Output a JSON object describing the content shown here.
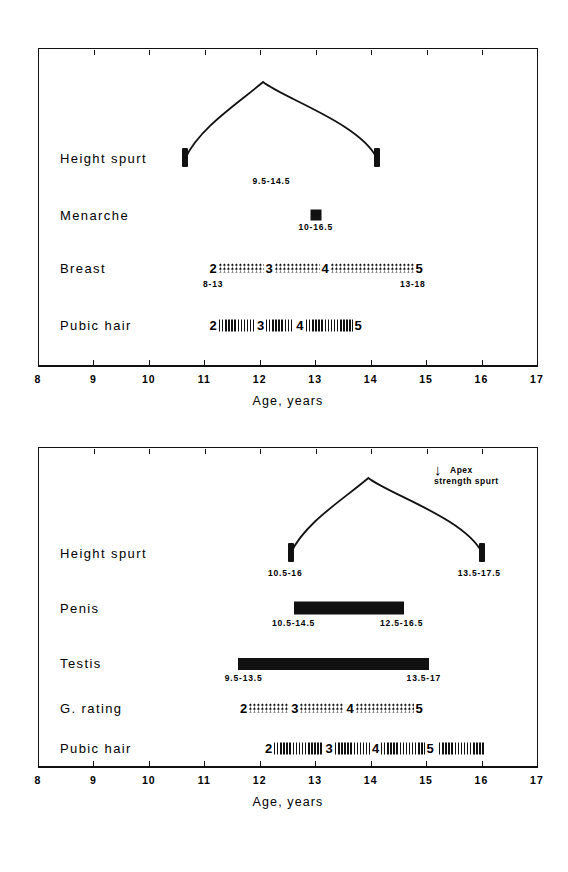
{
  "figure": {
    "axis_title": "Age, years",
    "axis_min": 8,
    "axis_max": 17,
    "tick_labels": [
      "8",
      "9",
      "10",
      "11",
      "12",
      "13",
      "14",
      "15",
      "16",
      "17"
    ]
  },
  "chart_data": {
    "type": "bar",
    "xlabel": "Age, years",
    "ylabel": "",
    "xlim": [
      8,
      17
    ],
    "grid": false,
    "legend": "none",
    "panels": [
      {
        "name": "girls",
        "rows": [
          {
            "label": "Height spurt",
            "kind": "spurt",
            "start": 10.65,
            "peak": 12.05,
            "end": 14.1,
            "notes": [
              {
                "text": "9.5-14.5",
                "x": 12.2
              }
            ]
          },
          {
            "label": "Menarche",
            "kind": "point",
            "at": 13.0,
            "notes": [
              {
                "text": "10-16.5",
                "x": 13.0
              }
            ]
          },
          {
            "label": "Breast",
            "kind": "stages",
            "fill": "dots",
            "start": 11.05,
            "end": 14.95,
            "stages": [
              "2",
              "3",
              "4",
              "5"
            ],
            "segment_widths": [
              1,
              1,
              1.85
            ],
            "notes": [
              {
                "text": "8-13",
                "x": 11.15
              },
              {
                "text": "13-18",
                "x": 14.75
              }
            ]
          },
          {
            "label": "Pubic hair",
            "kind": "stages",
            "fill": "hatch",
            "start": 11.05,
            "end": 13.85,
            "stages": [
              "2",
              "3",
              "4",
              "5"
            ],
            "segment_widths": [
              1,
              0.78,
              1.3
            ],
            "notes": []
          }
        ]
      },
      {
        "name": "boys",
        "annotation": {
          "line1": "Apex",
          "line2": "strength spurt",
          "arrow": "↓"
        },
        "rows": [
          {
            "label": "Height spurt",
            "kind": "spurt",
            "start": 12.55,
            "peak": 13.95,
            "end": 16.0,
            "notes": [
              {
                "text": "10.5-16",
                "x": 12.45
              },
              {
                "text": "13.5-17.5",
                "x": 15.95
              }
            ]
          },
          {
            "label": "Penis",
            "kind": "solid",
            "start": 12.6,
            "end": 14.6,
            "notes": [
              {
                "text": "10.5-14.5",
                "x": 12.6
              },
              {
                "text": "12.5-16.5",
                "x": 14.55
              }
            ]
          },
          {
            "label": "Testis",
            "kind": "solid",
            "start": 11.6,
            "end": 15.05,
            "notes": [
              {
                "text": "9.5-13.5",
                "x": 11.7
              },
              {
                "text": "13.5-17",
                "x": 14.95
              }
            ]
          },
          {
            "label": "G. rating",
            "kind": "stages",
            "fill": "dots",
            "start": 11.6,
            "end": 14.95,
            "stages": [
              "2",
              "3",
              "4",
              "5"
            ],
            "segment_widths": [
              1,
              1.1,
              1.45
            ],
            "notes": []
          },
          {
            "label": "Pubic hair",
            "kind": "stages",
            "fill": "hatch",
            "start": 12.05,
            "end": 16.0,
            "stages": [
              "2",
              "3",
              "4",
              "5"
            ],
            "segment_widths": [
              1.25,
              0.9,
              1.1
            ],
            "trailing_fill": 1.2,
            "notes": []
          }
        ]
      }
    ]
  }
}
